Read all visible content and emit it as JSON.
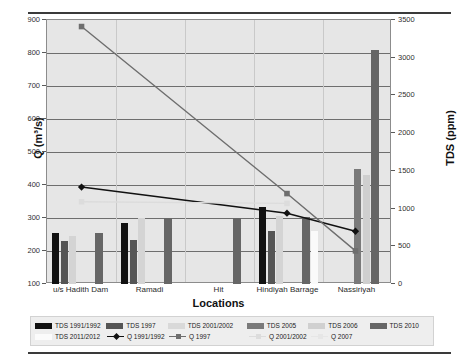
{
  "chart_data": {
    "type": "bar",
    "title": "",
    "xlabel": "Locations",
    "ylabel": "Q (m³/s)",
    "ylabel_right": "TDS (ppm)",
    "categories": [
      "u/s Hadith Dam",
      "Ramadi",
      "Hit",
      "Hindiyah Barrage",
      "Nassiriyah"
    ],
    "ylim": [
      100,
      900
    ],
    "yticks": [
      100,
      200,
      300,
      400,
      500,
      600,
      700,
      800,
      900
    ],
    "ylim_right": [
      0,
      3500
    ],
    "yticks_right": [
      0,
      500,
      1000,
      1500,
      2000,
      2500,
      3000,
      3500
    ],
    "grid": true,
    "legend_position": "bottom",
    "bar_series": [
      {
        "name": "TDS 1991/1992",
        "axis": "right",
        "color": "#111111",
        "values": [
          680,
          815,
          null,
          1020,
          null
        ]
      },
      {
        "name": "TDS 1997",
        "axis": "right",
        "color": "#555555",
        "values": [
          565,
          580,
          null,
          700,
          null
        ]
      },
      {
        "name": "TDS 2001/2002",
        "axis": "right",
        "color": "#d4d4d4",
        "values": [
          630,
          880,
          null,
          905,
          null
        ]
      },
      {
        "name": "TDS 2005",
        "axis": "right",
        "color": "#7a7a7a",
        "values": [
          null,
          null,
          null,
          null,
          1520
        ]
      },
      {
        "name": "TDS 2006",
        "axis": "right",
        "color": "#cfcfcf",
        "values": [
          null,
          null,
          null,
          null,
          1450
        ]
      },
      {
        "name": "TDS 2010",
        "axis": "right",
        "color": "#666666",
        "values": [
          680,
          875,
          875,
          890,
          3100
        ]
      },
      {
        "name": "TDS 2011/2012",
        "axis": "right",
        "color": "#fafafa",
        "values": [
          null,
          null,
          null,
          700,
          null
        ]
      }
    ],
    "line_series": [
      {
        "name": "Q 1991/1992",
        "axis": "left",
        "color": "#111111",
        "marker": "diamond",
        "points": [
          {
            "x": "u/s Hadith Dam",
            "y": 390
          },
          {
            "x": "Hindiyah Barrage",
            "y": 310
          },
          {
            "x": "Nassiriyah",
            "y": 255
          }
        ]
      },
      {
        "name": "Q 1997",
        "axis": "left",
        "color": "#6e6e6e",
        "marker": "square",
        "points": [
          {
            "x": "u/s Hadith Dam",
            "y": 880
          },
          {
            "x": "Hindiyah Barrage",
            "y": 370
          },
          {
            "x": "Nassiriyah",
            "y": 195
          }
        ]
      },
      {
        "name": "Q 2001/2002",
        "axis": "left",
        "color": "#dcdcdc",
        "marker": "square",
        "points": [
          {
            "x": "u/s Hadith Dam",
            "y": 345
          },
          {
            "x": "Hindiyah Barrage",
            "y": 340
          }
        ]
      },
      {
        "name": "Q 2007",
        "axis": "left",
        "color": "#e4e4e4",
        "marker": "square",
        "points": []
      }
    ]
  },
  "legend": {
    "row1": [
      {
        "label": "TDS 1991/1992",
        "color": "#111111",
        "kind": "bar"
      },
      {
        "label": "TDS 1997",
        "color": "#555555",
        "kind": "bar"
      },
      {
        "label": "TDS 2001/2002",
        "color": "#d9d9d9",
        "kind": "bar"
      },
      {
        "label": "TDS 2005",
        "color": "#7a7a7a",
        "kind": "bar"
      },
      {
        "label": "TDS 2006",
        "color": "#d0d0d0",
        "kind": "bar"
      },
      {
        "label": "TDS 2010",
        "color": "#666666",
        "kind": "bar"
      }
    ],
    "row2": [
      {
        "label": "TDS 2011/2012",
        "color": "#fbfbfb",
        "kind": "bar"
      },
      {
        "label": "Q 1991/1992",
        "color": "#111111",
        "kind": "line-diamond"
      },
      {
        "label": "Q 1997",
        "color": "#6e6e6e",
        "kind": "line-square"
      },
      {
        "label": "Q 2001/2002",
        "color": "#dcdcdc",
        "kind": "line-square"
      },
      {
        "label": "Q 2007",
        "color": "#e6e6e6",
        "kind": "line-square"
      }
    ]
  },
  "colors": {
    "plot_background": "#e6e6e6",
    "legend_background": "#eeeeee",
    "gridline": "#6e6e6e",
    "axis_text": "#303030"
  }
}
